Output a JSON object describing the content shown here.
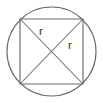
{
  "figure": {
    "kind": "geometry-diagram",
    "background_color": "#ffffff",
    "stroke_color": "#6b6b6b",
    "label_color": "#2c2c2c",
    "canvas": {
      "width": 103,
      "height": 103
    },
    "circle": {
      "name": "circumscribed-circle",
      "cx": 51.5,
      "cy": 51.5,
      "r": 44.5
    },
    "square": {
      "name": "inscribed-square",
      "x": 20,
      "y": 19,
      "width": 63,
      "height": 65,
      "corners": [
        {
          "name": "top-left",
          "x": 20,
          "y": 19
        },
        {
          "name": "top-right",
          "x": 83,
          "y": 19
        },
        {
          "name": "bottom-right",
          "x": 83,
          "y": 84
        },
        {
          "name": "bottom-left",
          "x": 20,
          "y": 84
        }
      ]
    },
    "diagonals": [
      {
        "name": "diagonal-tl-br",
        "x1": 20,
        "y1": 19,
        "x2": 83,
        "y2": 84
      },
      {
        "name": "diagonal-tr-bl",
        "x1": 83,
        "y1": 19,
        "x2": 20,
        "y2": 84
      }
    ],
    "center": {
      "name": "circle-center",
      "x": 51.5,
      "y": 51.5
    },
    "labels": [
      {
        "name": "radius-label-upper-left",
        "text": "r",
        "x": 41,
        "y": 35
      },
      {
        "name": "radius-label-right",
        "text": "r",
        "x": 70,
        "y": 49
      }
    ]
  }
}
